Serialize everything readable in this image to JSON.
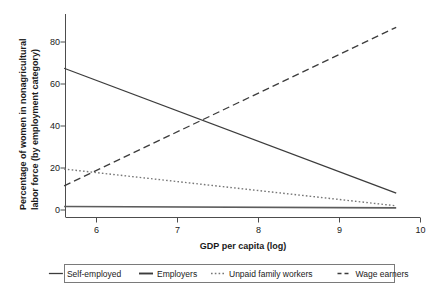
{
  "chart_data": {
    "type": "line",
    "title": "",
    "subtitle": "",
    "xlabel": "GDP per capita (log)",
    "ylabel": "Percentage of women in nonagricultural labor force (by employment category)",
    "xlim": [
      5.45,
      10.05
    ],
    "ylim": [
      -1.5,
      92
    ],
    "xticks": [
      6,
      7,
      8,
      9,
      10
    ],
    "yticks": [
      0,
      20,
      40,
      60,
      80
    ],
    "xtick_labels": [
      "6",
      "7",
      "8",
      "9",
      "10"
    ],
    "ytick_labels": [
      "0",
      "20",
      "40",
      "60",
      "80"
    ],
    "grid": false,
    "legend_position": "bottom",
    "x": [
      5.6,
      9.7
    ],
    "series": [
      {
        "name": "Self-employed",
        "linestyle": "solid",
        "color": "#3c3c3c",
        "linewidth": 1.3,
        "values": [
          67.5,
          8.0
        ]
      },
      {
        "name": "Employers",
        "linestyle": "solid",
        "color": "#5c5c5c",
        "linewidth": 1.6,
        "values": [
          1.7,
          1.0
        ]
      },
      {
        "name": "Unpaid family workers",
        "linestyle": "dotted",
        "color": "#777777",
        "linewidth": 1.4,
        "values": [
          19.5,
          2.0
        ]
      },
      {
        "name": "Wage earners",
        "linestyle": "dashed",
        "color": "#3c3c3c",
        "linewidth": 1.3,
        "values": [
          11.5,
          87.0
        ]
      }
    ],
    "annotations": []
  },
  "legend": {
    "items": [
      {
        "label": "Self-employed",
        "style": "solid"
      },
      {
        "label": "Employers",
        "style": "solid-thick"
      },
      {
        "label": "Unpaid family workers",
        "style": "dotted"
      },
      {
        "label": "Wage earners",
        "style": "dashed"
      }
    ]
  },
  "axes": {
    "x_title": "GDP per capita (log)",
    "y_title_line1": "Percentage of women in nonagricultural",
    "y_title_line2": "labor force (by employment category)"
  }
}
